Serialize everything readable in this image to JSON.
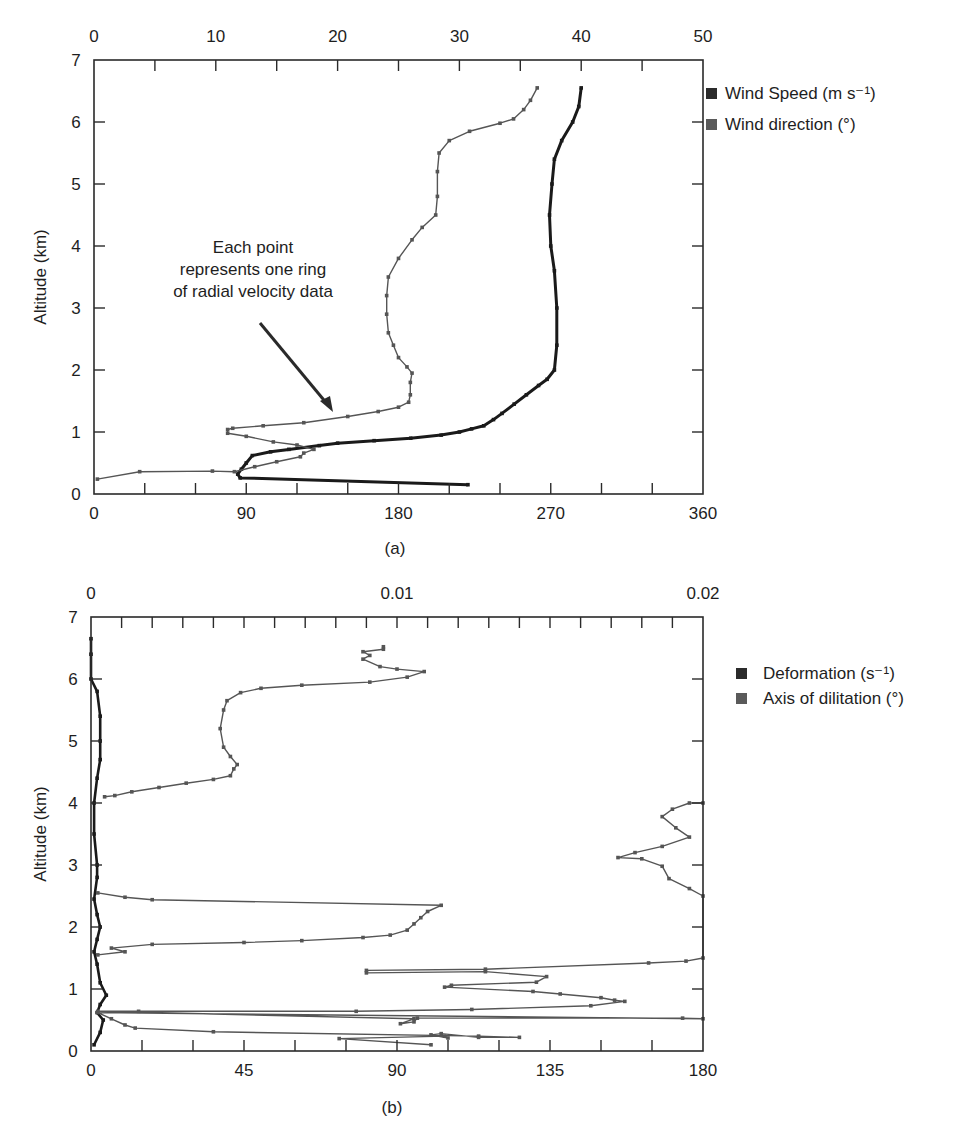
{
  "chart_data": [
    {
      "id": "a",
      "type": "line",
      "panel_label": "(a)",
      "orientation": "vertical-profile",
      "ylabel": "Altitude (km)",
      "ylim": [
        0,
        7
      ],
      "yticks": [
        "0",
        "1",
        "2",
        "3",
        "4",
        "5",
        "6",
        "7"
      ],
      "x_bottom": {
        "label": "",
        "lim": [
          0,
          360
        ],
        "ticks": [
          "0",
          "90",
          "180",
          "270",
          "360"
        ],
        "minor_step": 30
      },
      "x_top": {
        "label": "",
        "lim": [
          0,
          50
        ],
        "ticks": [
          "0",
          "10",
          "20",
          "30",
          "40",
          "50"
        ],
        "minor_step": 5
      },
      "legend_position": "right",
      "annotation": {
        "lines": [
          "Each point",
          "represents one ring",
          "of radial velocity data"
        ],
        "arrow_to_altitude_km": 1.25
      },
      "series": [
        {
          "name": "Wind Speed (m s⁻¹)",
          "axis": "top",
          "color": "#1a1a1a",
          "points": [
            [
              30.7,
              0.15
            ],
            [
              12.0,
              0.26
            ],
            [
              11.8,
              0.32
            ],
            [
              12.1,
              0.4
            ],
            [
              12.5,
              0.5
            ],
            [
              13.0,
              0.62
            ],
            [
              14.5,
              0.68
            ],
            [
              16.0,
              0.72
            ],
            [
              18.5,
              0.78
            ],
            [
              20.0,
              0.82
            ],
            [
              23.0,
              0.86
            ],
            [
              26.0,
              0.9
            ],
            [
              28.5,
              0.95
            ],
            [
              30.0,
              1.0
            ],
            [
              31.0,
              1.05
            ],
            [
              32.0,
              1.1
            ],
            [
              32.8,
              1.2
            ],
            [
              33.5,
              1.3
            ],
            [
              34.5,
              1.45
            ],
            [
              35.5,
              1.6
            ],
            [
              36.5,
              1.75
            ],
            [
              37.2,
              1.85
            ],
            [
              37.8,
              2.0
            ],
            [
              38.0,
              2.4
            ],
            [
              38.0,
              3.0
            ],
            [
              37.8,
              3.6
            ],
            [
              37.5,
              4.0
            ],
            [
              37.4,
              4.5
            ],
            [
              37.6,
              5.0
            ],
            [
              37.8,
              5.4
            ],
            [
              38.4,
              5.7
            ],
            [
              39.3,
              6.0
            ],
            [
              39.8,
              6.25
            ],
            [
              40.0,
              6.55
            ]
          ]
        },
        {
          "name": "Wind direction (°)",
          "axis": "bottom",
          "color": "#555555",
          "points": [
            [
              2,
              0.24
            ],
            [
              27,
              0.36
            ],
            [
              70,
              0.37
            ],
            [
              83,
              0.36
            ],
            [
              95,
              0.44
            ],
            [
              108,
              0.52
            ],
            [
              122,
              0.6
            ],
            [
              124,
              0.66
            ],
            [
              130,
              0.72
            ],
            [
              120,
              0.79
            ],
            [
              106,
              0.84
            ],
            [
              90,
              0.93
            ],
            [
              79,
              0.98
            ],
            [
              79,
              1.04
            ],
            [
              82,
              1.06
            ],
            [
              100,
              1.1
            ],
            [
              124,
              1.15
            ],
            [
              150,
              1.25
            ],
            [
              168,
              1.33
            ],
            [
              180,
              1.4
            ],
            [
              186,
              1.48
            ],
            [
              187,
              1.6
            ],
            [
              187,
              1.8
            ],
            [
              188,
              1.95
            ],
            [
              185,
              2.05
            ],
            [
              180,
              2.2
            ],
            [
              177,
              2.4
            ],
            [
              174,
              2.6
            ],
            [
              173,
              2.9
            ],
            [
              173,
              3.2
            ],
            [
              174,
              3.5
            ],
            [
              180,
              3.8
            ],
            [
              188,
              4.1
            ],
            [
              194,
              4.3
            ],
            [
              202,
              4.5
            ],
            [
              203,
              4.8
            ],
            [
              203,
              5.2
            ],
            [
              204,
              5.5
            ],
            [
              210,
              5.7
            ],
            [
              222,
              5.85
            ],
            [
              240,
              5.98
            ],
            [
              248,
              6.05
            ],
            [
              254,
              6.2
            ],
            [
              258,
              6.35
            ],
            [
              262,
              6.55
            ]
          ]
        }
      ]
    },
    {
      "id": "b",
      "type": "line",
      "panel_label": "(b)",
      "orientation": "vertical-profile",
      "ylabel": "Altitude (km)",
      "ylim": [
        0,
        7
      ],
      "yticks": [
        "0",
        "1",
        "2",
        "3",
        "4",
        "5",
        "6",
        "7"
      ],
      "x_bottom": {
        "label": "",
        "lim": [
          0,
          180
        ],
        "ticks": [
          "0",
          "45",
          "90",
          "135",
          "180"
        ],
        "minor_step": 15
      },
      "x_top": {
        "label": "",
        "lim": [
          0,
          0.02
        ],
        "ticks": [
          "0",
          "0.01",
          "0.02"
        ],
        "minor_step": 0.001
      },
      "legend_position": "right",
      "series": [
        {
          "name": "Deformation (s⁻¹)",
          "axis": "top",
          "color": "#1a1a1a",
          "points": [
            [
              0.0001,
              0.1
            ],
            [
              0.0003,
              0.3
            ],
            [
              0.0004,
              0.5
            ],
            [
              0.0002,
              0.62
            ],
            [
              0.0003,
              0.75
            ],
            [
              0.0005,
              0.9
            ],
            [
              0.0003,
              1.1
            ],
            [
              0.0002,
              1.4
            ],
            [
              0.0001,
              1.6
            ],
            [
              0.0002,
              1.8
            ],
            [
              0.0003,
              2.0
            ],
            [
              0.0002,
              2.2
            ],
            [
              0.0001,
              2.45
            ],
            [
              0.0002,
              2.8
            ],
            [
              0.0002,
              3.0
            ],
            [
              0.0001,
              3.5
            ],
            [
              0.0001,
              4.0
            ],
            [
              0.0002,
              4.4
            ],
            [
              0.0003,
              4.7
            ],
            [
              0.0003,
              5.0
            ],
            [
              0.0003,
              5.4
            ],
            [
              0.0002,
              5.8
            ],
            [
              0.0,
              6.0
            ],
            [
              0.0,
              6.4
            ],
            [
              0.0,
              6.65
            ]
          ]
        },
        {
          "name": "Axis of dilitation (°)",
          "axis": "bottom",
          "color": "#555555",
          "points": [
            [
              100,
              0.1
            ],
            [
              73,
              0.2
            ],
            [
              104,
              0.24
            ],
            [
              105,
              0.21
            ],
            [
              100,
              0.26
            ],
            [
              103,
              0.28
            ],
            [
              114,
              0.22
            ],
            [
              126,
              0.22
            ],
            [
              114,
              0.24
            ],
            [
              36,
              0.31
            ],
            [
              13,
              0.37
            ],
            [
              10,
              0.42
            ],
            [
              6,
              0.52
            ],
            [
              2,
              0.62
            ],
            [
              180,
              0.52
            ],
            [
              174,
              0.53
            ],
            [
              96,
              0.53
            ],
            [
              95,
              0.47
            ],
            [
              91,
              0.44
            ],
            [
              95,
              0.52
            ],
            [
              2,
              0.64
            ],
            [
              14,
              0.64
            ],
            [
              78,
              0.64
            ],
            [
              112,
              0.67
            ],
            [
              147,
              0.73
            ],
            [
              157,
              0.8
            ],
            [
              154,
              0.82
            ],
            [
              150,
              0.86
            ],
            [
              138,
              0.92
            ],
            [
              130,
              0.96
            ],
            [
              104,
              1.03
            ],
            [
              106,
              1.06
            ],
            [
              131,
              1.11
            ],
            [
              134,
              1.2
            ],
            [
              116,
              1.28
            ],
            [
              81,
              1.26
            ],
            [
              81,
              1.3
            ],
            [
              116,
              1.32
            ],
            [
              164,
              1.42
            ],
            [
              175,
              1.45
            ],
            [
              180,
              1.5
            ],
            [
              180,
              2.5
            ],
            [
              176,
              2.62
            ],
            [
              170,
              2.78
            ],
            [
              168,
              2.98
            ],
            [
              162,
              3.1
            ],
            [
              155,
              3.12
            ],
            [
              160,
              3.2
            ],
            [
              168,
              3.3
            ],
            [
              176,
              3.45
            ],
            [
              172,
              3.6
            ],
            [
              168,
              3.78
            ],
            [
              171,
              3.9
            ],
            [
              176,
              4.0
            ],
            [
              180,
              4.0
            ]
          ],
          "extra_segments": [
            [
              [
                2,
                1.55
              ],
              [
                10,
                1.6
              ],
              [
                6,
                1.66
              ],
              [
                18,
                1.72
              ],
              [
                45,
                1.75
              ],
              [
                62,
                1.78
              ],
              [
                80,
                1.83
              ],
              [
                88,
                1.87
              ],
              [
                93,
                1.95
              ],
              [
                95,
                2.05
              ],
              [
                97,
                2.15
              ],
              [
                99,
                2.25
              ],
              [
                103,
                2.35
              ],
              [
                18,
                2.44
              ],
              [
                10,
                2.48
              ],
              [
                2,
                2.55
              ]
            ],
            [
              [
                4,
                4.1
              ],
              [
                7,
                4.12
              ],
              [
                12,
                4.18
              ],
              [
                20,
                4.25
              ],
              [
                28,
                4.32
              ],
              [
                36,
                4.38
              ],
              [
                41,
                4.44
              ],
              [
                42,
                4.55
              ],
              [
                43,
                4.62
              ],
              [
                41,
                4.75
              ],
              [
                39,
                4.9
              ],
              [
                38,
                5.2
              ],
              [
                39,
                5.5
              ],
              [
                40,
                5.65
              ],
              [
                44,
                5.78
              ],
              [
                50,
                5.85
              ],
              [
                62,
                5.9
              ],
              [
                82,
                5.95
              ],
              [
                93,
                6.03
              ],
              [
                98,
                6.12
              ],
              [
                90,
                6.16
              ],
              [
                85,
                6.2
              ],
              [
                80,
                6.32
              ],
              [
                82,
                6.38
              ],
              [
                80,
                6.44
              ],
              [
                86,
                6.48
              ],
              [
                86,
                6.52
              ]
            ]
          ]
        }
      ]
    }
  ],
  "charts": {
    "a": {
      "panel_label": "(a)",
      "ylabel": "Altitude (km)",
      "legend": [
        "Wind Speed (m s⁻¹)",
        "Wind direction (°)"
      ],
      "annotation": [
        "Each point",
        "represents one ring",
        "of radial velocity data"
      ]
    },
    "b": {
      "panel_label": "(b)",
      "ylabel": "Altitude (km)",
      "legend": [
        "Deformation (s⁻¹)",
        "Axis of dilitation (°)"
      ]
    }
  },
  "colors": {
    "axis": "#2a2a2a",
    "series_dark": "#1a1a1a",
    "series_grey": "#555555",
    "legend_dark": "#2b2b2b",
    "legend_grey": "#5a5a5a"
  }
}
